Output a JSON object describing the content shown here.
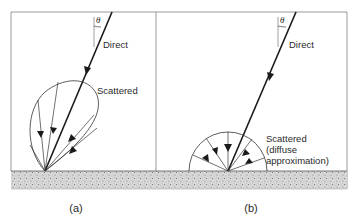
{
  "figure": {
    "panels": [
      {
        "id": "a",
        "caption": "(a)",
        "direct_label": "Direct",
        "scattered_label": "Scattered",
        "angle_symbol": "θ"
      },
      {
        "id": "b",
        "caption": "(b)",
        "direct_label": "Direct",
        "scattered_label_lines": [
          "Scattered",
          "(diffuse",
          "approximation)"
        ],
        "angle_symbol": "θ"
      }
    ],
    "colors": {
      "line": "#1a1a1a",
      "frame": "#9a9a9a",
      "ground": "#cfcfcf"
    }
  }
}
